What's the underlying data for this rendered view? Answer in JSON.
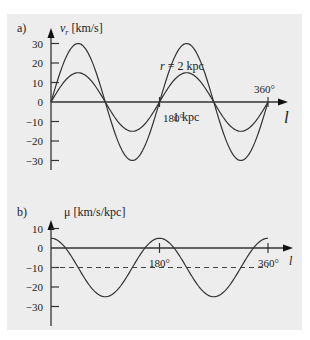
{
  "chart_data": [
    {
      "type": "line",
      "panel_label": "a)",
      "ylabel": "v_r [km/s]",
      "ylabel_main": "v",
      "ylabel_sub": "r",
      "ylabel_units": " [km/s]",
      "xlabel": "l",
      "yticks": [
        30,
        20,
        10,
        0,
        -10,
        -20,
        -30
      ],
      "ytick_labels": [
        "30",
        "20",
        "10",
        "0",
        "−10",
        "−20",
        "−30"
      ],
      "xticks": [
        180,
        360
      ],
      "xtick_labels": [
        "180°",
        "360°"
      ],
      "ylim": [
        -38,
        38
      ],
      "xlim": [
        0,
        370
      ],
      "grid": false,
      "series": [
        {
          "name": "r = 2 kpc",
          "label": "r = 2 kpc",
          "formula": "30*sin(2l)",
          "x": [
            0,
            45,
            90,
            135,
            180,
            225,
            270,
            315,
            360
          ],
          "values": [
            0,
            30,
            0,
            -30,
            0,
            30,
            0,
            -30,
            0
          ]
        },
        {
          "name": "1 kpc",
          "label": "1 kpc",
          "formula": "15*sin(2l)",
          "x": [
            0,
            45,
            90,
            135,
            180,
            225,
            270,
            315,
            360
          ],
          "values": [
            0,
            15,
            0,
            -15,
            0,
            15,
            0,
            -15,
            0
          ]
        }
      ]
    },
    {
      "type": "line",
      "panel_label": "b)",
      "ylabel": "μ [km/s/kpc]",
      "xlabel": "l",
      "yticks": [
        10,
        0,
        -10,
        -20,
        -30
      ],
      "ytick_labels": [
        "10",
        "0",
        "−10",
        "−20",
        "−30"
      ],
      "xticks": [
        180,
        360
      ],
      "xtick_labels": [
        "180°",
        "360°"
      ],
      "ylim": [
        -38,
        18
      ],
      "xlim": [
        0,
        370
      ],
      "grid": false,
      "series": [
        {
          "name": "mu",
          "formula": "-10 + 15*cos(2l)",
          "x": [
            0,
            45,
            90,
            135,
            180,
            225,
            270,
            315,
            360
          ],
          "values": [
            5,
            -10,
            -25,
            -10,
            5,
            -10,
            -25,
            -10,
            5
          ]
        }
      ],
      "reference_line": {
        "y": -10,
        "style": "dashed"
      }
    }
  ]
}
